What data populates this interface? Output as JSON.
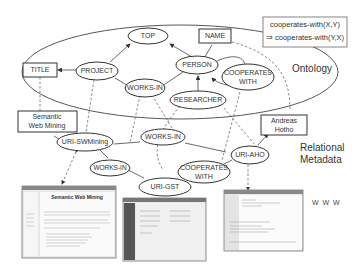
{
  "ontology_layer": {
    "label": "Ontology",
    "concepts": {
      "top": "TOP",
      "project": "PROJECT",
      "person": "PERSON",
      "works_in": "WORKS-IN",
      "researcher": "RESEARCHER",
      "cooperates_with_l1": "COOPERATES",
      "cooperates_with_l2": "WITH"
    },
    "attributes": {
      "title": "TITLE",
      "name": "NAME"
    },
    "axiom": {
      "line1": "cooperates-with(X,Y)",
      "line2": "⇒ cooperates-with(Y,X)"
    }
  },
  "metadata_layer": {
    "label_l1": "Relational",
    "label_l2": "Metadata",
    "instances": {
      "uri_swmining": "URI-SWMining",
      "uri_gst": "URI-GST",
      "uri_aho": "URI-AHO",
      "works_in_a": "WORKS-IN",
      "works_in_b": "WORKS-IN",
      "cooperates_l1": "COOPERATES",
      "cooperates_l2": "WITH"
    },
    "literals": {
      "semantic_l1": "Semantic",
      "semantic_l2": "Web Mining",
      "andreas_l1": "Andreas",
      "andreas_l2": "Hotho"
    }
  },
  "www_layer": {
    "label": "W W W",
    "screenshots": {
      "swmining_title": "Semantic Web Mining"
    }
  }
}
